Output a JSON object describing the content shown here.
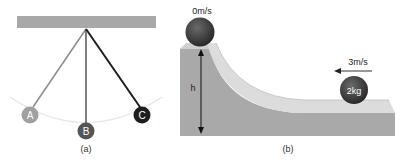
{
  "figure_a": {
    "caption": "(a)",
    "balls": [
      {
        "label": "A",
        "color": "#a0a0a0"
      },
      {
        "label": "B",
        "color": "#555555"
      },
      {
        "label": "C",
        "color": "#1e1e1e"
      }
    ],
    "ceiling_color": "#a8a8a8",
    "arc_color": "#e4e4e4"
  },
  "figure_b": {
    "caption": "(b)",
    "top_ball_velocity": "0m/s",
    "height_label": "h",
    "moving_ball_mass": "2kg",
    "moving_ball_velocity": "3m/s",
    "block_color": "#a9a9a9",
    "track_color": "#dcdcdc",
    "ball_color": "#3a3a3a"
  }
}
